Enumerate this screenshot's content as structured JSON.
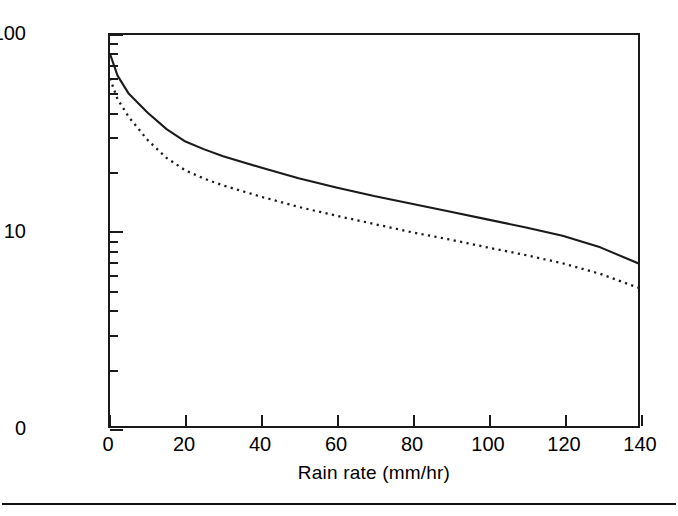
{
  "figure": {
    "background_color": "#ffffff",
    "frame_color": "#1a1a1a",
    "has_bottom_rule": true
  },
  "chart_data": {
    "type": "line",
    "title": "",
    "subtitle": "",
    "xlabel": "Rain rate (mm/hr)",
    "ylabel": "Range (km)",
    "xlim": [
      0,
      140
    ],
    "ylim": [
      1,
      100
    ],
    "xscale": "linear",
    "yscale": "log",
    "grid": false,
    "legend": null,
    "legend_position": "none",
    "xticks": [
      0,
      20,
      40,
      60,
      80,
      100,
      120,
      140
    ],
    "xticklabels": [
      "0",
      "20",
      "40",
      "60",
      "80",
      "100",
      "120",
      "140"
    ],
    "yticks": [
      100,
      10,
      1
    ],
    "yticklabels": [
      "100",
      "10",
      "0"
    ],
    "y_minor_ticks": [
      90,
      80,
      70,
      60,
      50,
      40,
      30,
      20,
      9,
      8,
      7,
      6,
      5,
      4,
      3,
      2
    ],
    "x": [
      0,
      2,
      5,
      10,
      15,
      20,
      25,
      30,
      40,
      50,
      60,
      70,
      80,
      90,
      100,
      110,
      120,
      130,
      140
    ],
    "series": [
      {
        "name": "solid-curve",
        "style": "solid",
        "color": "#1a1a1a",
        "values": [
          80.0,
          62.0,
          50.0,
          40.0,
          33.0,
          28.5,
          26.0,
          24.0,
          21.0,
          18.5,
          16.6,
          15.0,
          13.7,
          12.5,
          11.4,
          10.4,
          9.4,
          8.2,
          6.8
        ]
      },
      {
        "name": "dotted-curve",
        "style": "dotted",
        "color": "#1a1a1a",
        "values": [
          60.0,
          47.0,
          38.0,
          29.0,
          23.5,
          20.3,
          18.4,
          17.0,
          14.9,
          13.2,
          11.9,
          10.8,
          9.8,
          9.0,
          8.2,
          7.5,
          6.8,
          6.0,
          5.1
        ]
      }
    ]
  },
  "axes": {
    "y_title": "Range (km)",
    "x_title": "Rain rate (mm/hr)"
  }
}
